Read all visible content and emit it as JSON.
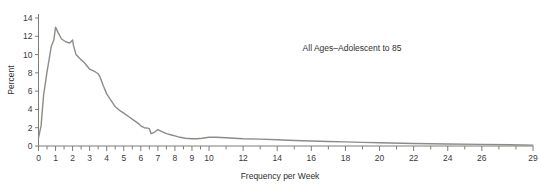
{
  "chart_data": {
    "type": "line",
    "title": "",
    "annotation": "All Ages–Adolescent to 85",
    "xlabel": "Frequency per Week",
    "ylabel": "Percent",
    "xlim": [
      0,
      29
    ],
    "ylim": [
      0,
      14
    ],
    "grid": false,
    "legend": null,
    "line_color": "#8c8c86",
    "x_tick_labels": [
      "0",
      "1",
      "2",
      "3",
      "4",
      "5",
      "6",
      "7",
      "8",
      "9",
      "10",
      "12",
      "14",
      "16",
      "18",
      "20",
      "22",
      "24",
      "26",
      "29"
    ],
    "x_tick_values": [
      0,
      1,
      2,
      3,
      4,
      5,
      6,
      7,
      8,
      9,
      10,
      12,
      14,
      16,
      18,
      20,
      22,
      24,
      26,
      29
    ],
    "x_minor_step_low": 0.5,
    "x_minor_step_high": 1,
    "x_minor_breakpoint": 10,
    "y_tick_labels": [
      "0",
      "2",
      "4",
      "6",
      "8",
      "10",
      "12",
      "14"
    ],
    "y_tick_values": [
      0,
      2,
      4,
      6,
      8,
      10,
      12,
      14
    ],
    "x": [
      0,
      0.15,
      0.3,
      0.5,
      0.75,
      0.9,
      1.0,
      1.15,
      1.35,
      1.6,
      1.75,
      1.85,
      2.0,
      2.05,
      2.2,
      2.45,
      2.7,
      3.0,
      3.25,
      3.5,
      3.6,
      3.8,
      4.0,
      4.25,
      4.5,
      4.75,
      5.0,
      5.3,
      5.6,
      5.9,
      6.0,
      6.2,
      6.4,
      6.5,
      6.6,
      6.8,
      7.0,
      7.2,
      7.5,
      7.8,
      8.0,
      8.3,
      8.6,
      9.0,
      9.3,
      9.6,
      10.0,
      10.4,
      11.0,
      11.5,
      12.0,
      13.0,
      14.0,
      15.0,
      16.0,
      17.0,
      18.0,
      19.0,
      20.0,
      22.0,
      24.0,
      26.0,
      29.0
    ],
    "y": [
      0.9,
      2.2,
      5.6,
      8.1,
      10.9,
      11.6,
      13.0,
      12.4,
      11.7,
      11.4,
      11.3,
      11.3,
      11.6,
      11.0,
      10.0,
      9.5,
      9.1,
      8.4,
      8.2,
      7.9,
      7.6,
      6.6,
      5.7,
      5.0,
      4.3,
      3.9,
      3.6,
      3.2,
      2.8,
      2.4,
      2.2,
      2.0,
      1.95,
      1.9,
      1.35,
      1.5,
      1.8,
      1.6,
      1.35,
      1.2,
      1.1,
      0.95,
      0.85,
      0.8,
      0.8,
      0.85,
      0.95,
      0.95,
      0.9,
      0.85,
      0.8,
      0.75,
      0.68,
      0.6,
      0.55,
      0.5,
      0.45,
      0.4,
      0.35,
      0.28,
      0.22,
      0.18,
      0.1
    ]
  }
}
